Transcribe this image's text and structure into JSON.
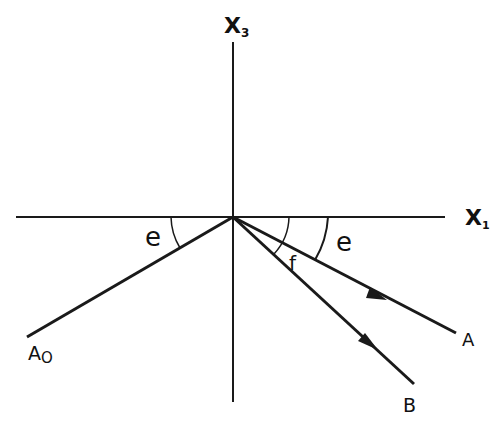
{
  "diagram": {
    "axes": {
      "vertical_label": "X",
      "vertical_subscript": "3",
      "horizontal_label": "X",
      "horizontal_subscript": "1"
    },
    "rays": {
      "incident_label": "A",
      "incident_subscript": "O",
      "reflected_a_label": "A",
      "reflected_b_label": "B"
    },
    "angles": {
      "incident_angle": "e",
      "reflected_angle": "e",
      "converted_angle": "f"
    },
    "colors": {
      "line": "#1a1a1a",
      "background": "#ffffff"
    }
  }
}
